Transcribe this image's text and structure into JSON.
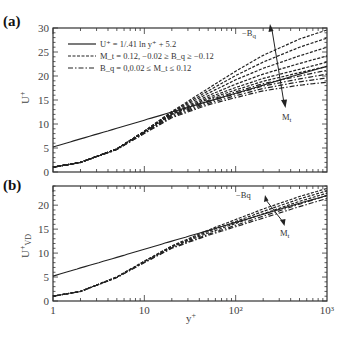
{
  "figure": {
    "panels": [
      {
        "id": "a",
        "label": "(a)",
        "ylabel": "U⁺"
      },
      {
        "id": "b",
        "label": "(b)",
        "ylabel": "U⁺_VD"
      }
    ],
    "xlabel": "y⁺",
    "xticks": [
      "1",
      "10",
      "10²",
      "10³"
    ],
    "annotations": {
      "a": {
        "arrow_up": "−B_q",
        "arrow_down": "M_t"
      },
      "b": {
        "arrow_up": "−Bq",
        "arrow_down": "M_t"
      }
    },
    "legend": [
      {
        "style": "solid",
        "text": "U⁺ = 1/.41 ln y⁺ + 5.2"
      },
      {
        "style": "dashed",
        "text": "M_t = 0.12, −0.02 ≥ B_q ≥ −0.12"
      },
      {
        "style": "dashdot",
        "text": "B_q = 0,0.02 ≤ M_t ≤ 0.12"
      }
    ]
  },
  "chart_data": [
    {
      "type": "line",
      "title": "(a)",
      "xlabel": "y+",
      "ylabel": "U+",
      "xscale": "log",
      "xlim": [
        1,
        1000
      ],
      "ylim": [
        0,
        30
      ],
      "yticks": [
        0,
        5,
        10,
        15,
        20,
        25,
        30
      ],
      "xticks": [
        1,
        10,
        100,
        1000
      ],
      "legend_position": "upper left",
      "grid": false,
      "x": [
        1,
        2,
        5,
        10,
        20,
        50,
        100,
        200,
        500,
        1000
      ],
      "series": [
        {
          "name": "U+ = 1/.41 ln y+ + 5.2",
          "style": "solid",
          "values": [
            5.2,
            6.9,
            9.1,
            10.8,
            12.5,
            14.7,
            16.4,
            18.1,
            20.4,
            22.0
          ]
        },
        {
          "name": "Mt=0.12, Bq=-0.12",
          "style": "dashed",
          "values": [
            1.0,
            2.0,
            4.8,
            8.5,
            12.6,
            17.4,
            21.0,
            24.3,
            27.7,
            29.6
          ]
        },
        {
          "name": "Mt=0.12, Bq=-0.10",
          "style": "dashed",
          "values": [
            1.0,
            2.0,
            4.8,
            8.5,
            12.5,
            16.9,
            20.1,
            22.9,
            26.0,
            27.9
          ]
        },
        {
          "name": "Mt=0.12, Bq=-0.08",
          "style": "dashed",
          "values": [
            1.0,
            2.0,
            4.8,
            8.5,
            12.4,
            16.4,
            19.2,
            21.6,
            24.2,
            26.0
          ]
        },
        {
          "name": "Mt=0.12, Bq=-0.06",
          "style": "dashed",
          "values": [
            1.0,
            2.0,
            4.8,
            8.4,
            12.2,
            15.9,
            18.3,
            20.4,
            22.6,
            24.2
          ]
        },
        {
          "name": "Mt=0.12, Bq=-0.04",
          "style": "dashed",
          "values": [
            1.0,
            2.0,
            4.8,
            8.4,
            12.1,
            15.5,
            17.6,
            19.5,
            21.4,
            22.9
          ]
        },
        {
          "name": "Mt=0.12, Bq=-0.02",
          "style": "dashed",
          "values": [
            1.0,
            2.0,
            4.8,
            8.4,
            12.0,
            15.2,
            17.1,
            18.9,
            20.7,
            22.0
          ]
        },
        {
          "name": "Bq=0, Mt=0.12",
          "style": "dashdot",
          "values": [
            1.0,
            2.0,
            4.8,
            8.3,
            11.9,
            14.9,
            16.7,
            18.4,
            20.0,
            21.2
          ]
        },
        {
          "name": "Bq=0, Mt=0.08",
          "style": "dashdot",
          "values": [
            1.0,
            2.0,
            4.7,
            8.2,
            11.7,
            14.6,
            16.3,
            17.9,
            19.4,
            20.4
          ]
        },
        {
          "name": "Bq=0, Mt=0.04",
          "style": "dashdot",
          "values": [
            1.0,
            2.0,
            4.7,
            8.1,
            11.5,
            14.3,
            15.9,
            17.4,
            18.8,
            19.6
          ]
        },
        {
          "name": "Bq=0, Mt=0.02",
          "style": "dashdot",
          "values": [
            1.0,
            2.0,
            4.7,
            8.0,
            11.3,
            14.0,
            15.5,
            16.9,
            18.1,
            18.7
          ]
        }
      ]
    },
    {
      "type": "line",
      "title": "(b)",
      "xlabel": "y+",
      "ylabel": "U+_VD",
      "xscale": "log",
      "xlim": [
        1,
        1000
      ],
      "ylim": [
        0,
        24
      ],
      "yticks": [
        0,
        5,
        10,
        15,
        20
      ],
      "xticks": [
        1,
        10,
        100,
        1000
      ],
      "grid": false,
      "x": [
        1,
        2,
        5,
        10,
        20,
        50,
        100,
        200,
        500,
        1000
      ],
      "series": [
        {
          "name": "U+ = 1/.41 ln y+ + 5.2",
          "style": "solid",
          "values": [
            5.2,
            6.9,
            9.1,
            10.8,
            12.5,
            14.7,
            16.4,
            18.1,
            20.4,
            22.0
          ]
        },
        {
          "name": "Mt=0.12, Bq=-0.12",
          "style": "dashed",
          "values": [
            1.0,
            2.0,
            5.0,
            8.3,
            11.5,
            14.8,
            17.0,
            19.2,
            21.8,
            23.5
          ]
        },
        {
          "name": "Mt=0.12, Bq=-0.08",
          "style": "dashed",
          "values": [
            1.0,
            2.0,
            5.0,
            8.3,
            11.4,
            14.5,
            16.6,
            18.7,
            21.3,
            23.0
          ]
        },
        {
          "name": "Mt=0.12, Bq=-0.04",
          "style": "dashed",
          "values": [
            1.0,
            2.0,
            5.0,
            8.2,
            11.3,
            14.2,
            16.2,
            18.2,
            20.8,
            22.5
          ]
        },
        {
          "name": "Bq=0, Mt=0.12",
          "style": "dashdot",
          "values": [
            1.0,
            2.0,
            4.9,
            8.1,
            11.1,
            13.9,
            15.8,
            17.7,
            20.2,
            22.0
          ]
        },
        {
          "name": "Bq=0, Mt=0.04",
          "style": "dashdot",
          "values": [
            1.0,
            2.0,
            4.9,
            8.0,
            11.0,
            13.7,
            15.5,
            17.3,
            19.7,
            21.4
          ]
        }
      ]
    }
  ]
}
